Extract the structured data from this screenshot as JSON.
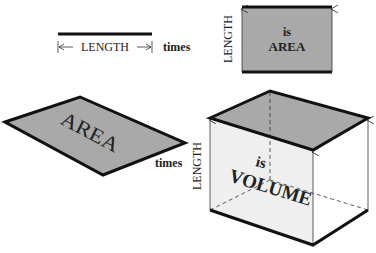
{
  "colors": {
    "face_gray": "#a9a9a9",
    "front_face": "#efefef",
    "side_face": "#ffffff",
    "stroke": "#111111"
  },
  "length_segment": {
    "label": "LENGTH",
    "times": "times"
  },
  "area_rectangle": {
    "side_label": "LENGTH",
    "is_label": "is",
    "area_label": "AREA"
  },
  "area_parallelogram": {
    "label": "AREA",
    "times": "times"
  },
  "volume_box": {
    "side_label": "LENGTH",
    "is_label": "is",
    "volume_label": "VOLUME"
  }
}
